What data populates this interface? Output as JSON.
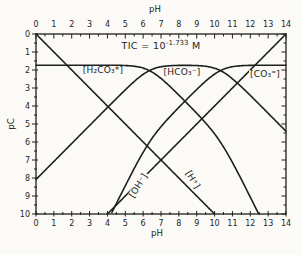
{
  "colors": {
    "ink": "#1f1f1f",
    "background": "#fbfaf6"
  },
  "chart_data": {
    "type": "line",
    "title": {
      "base": "TIC = 10",
      "exponent": "-1.733",
      "unit": "M"
    },
    "x_axis": {
      "label_top": "pH",
      "label_bottom": "pH",
      "min": 0,
      "max": 14,
      "major_ticks": [
        0,
        1,
        2,
        3,
        4,
        5,
        6,
        7,
        8,
        9,
        10,
        11,
        12,
        13,
        14
      ],
      "minor_step": 0.5
    },
    "y_axis": {
      "label": "pC",
      "min": 0,
      "max": 10,
      "major_ticks": [
        0,
        1,
        2,
        3,
        4,
        5,
        6,
        7,
        8,
        9,
        10
      ],
      "minor_step": 0.5,
      "increases_downward": true
    },
    "constants": {
      "pCT": 1.733,
      "pK1": 6.35,
      "pK2": 10.33,
      "pKw": 14
    },
    "series": [
      {
        "key": "h2co3",
        "name": "[H₂CO₃*]",
        "pH": [
          0,
          1,
          2,
          3,
          4,
          5,
          6,
          7,
          8,
          9,
          10,
          11,
          12,
          13,
          14
        ],
        "pC": [
          1.73,
          1.73,
          1.73,
          1.73,
          1.73,
          1.75,
          1.89,
          2.47,
          3.39,
          4.4,
          5.55,
          7.14,
          9.06,
          11.05,
          13.05
        ]
      },
      {
        "key": "hco3",
        "name": "[HCO₃⁻]",
        "pH": [
          0,
          1,
          2,
          3,
          4,
          5,
          6,
          7,
          8,
          9,
          10,
          11,
          12,
          13,
          14
        ],
        "pC": [
          8.08,
          7.08,
          6.08,
          5.08,
          4.09,
          3.1,
          2.24,
          1.82,
          1.74,
          1.75,
          1.9,
          2.49,
          3.41,
          4.4,
          5.4
        ]
      },
      {
        "key": "co3",
        "name": "[CO₃⁼]",
        "pH": [
          0,
          1,
          2,
          3,
          4,
          5,
          6,
          7,
          8,
          9,
          10,
          11,
          12,
          13,
          14
        ],
        "pC": [
          18.41,
          16.41,
          14.41,
          12.42,
          10.42,
          8.43,
          6.58,
          5.15,
          4.08,
          3.08,
          2.23,
          1.82,
          1.74,
          1.73,
          1.73
        ]
      },
      {
        "key": "h",
        "name": "[H⁺]",
        "pH": [
          0,
          1,
          2,
          3,
          4,
          5,
          6,
          7,
          8,
          9,
          10,
          11,
          12,
          13,
          14
        ],
        "pC": [
          0,
          1,
          2,
          3,
          4,
          5,
          6,
          7,
          8,
          9,
          10,
          11,
          12,
          13,
          14
        ]
      },
      {
        "key": "oh",
        "name": "[OH⁻]",
        "pH": [
          0,
          1,
          2,
          3,
          4,
          5,
          6,
          7,
          8,
          9,
          10,
          11,
          12,
          13,
          14
        ],
        "pC": [
          14,
          13,
          12,
          11,
          10,
          9,
          8,
          7,
          6,
          5,
          4,
          3,
          2,
          1,
          0
        ]
      }
    ],
    "labels": [
      {
        "key": "h2co3",
        "text": "[H₂CO₃*]",
        "x": 103,
        "y": 71,
        "rotation": 0
      },
      {
        "key": "hco3",
        "text": "[HCO₃⁻]",
        "x": 182,
        "y": 73,
        "rotation": 0
      },
      {
        "key": "co3",
        "text": "[CO₃⁼]",
        "x": 265,
        "y": 75,
        "rotation": 0
      },
      {
        "key": "oh",
        "text": "[OH⁻]",
        "x": 139,
        "y": 186,
        "rotation": -58
      },
      {
        "key": "h",
        "text": "[H⁺]",
        "x": 192,
        "y": 180,
        "rotation": 58
      }
    ],
    "plot": {
      "left": 36,
      "top": 34,
      "right": 286,
      "bottom": 214
    }
  }
}
